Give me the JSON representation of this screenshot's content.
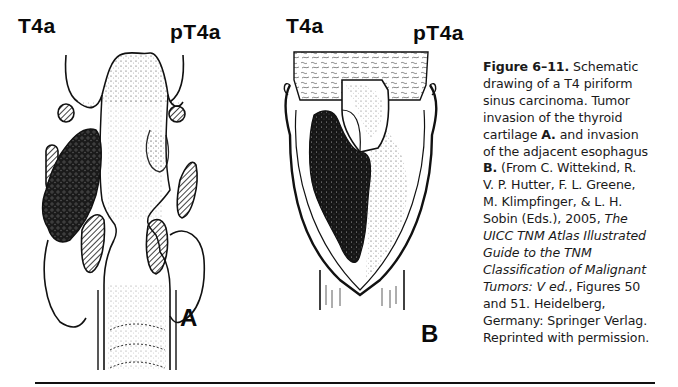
{
  "figure_a": {
    "label_left": "T4a",
    "label_right": "pT4a",
    "panel_letter": "A"
  },
  "figure_b": {
    "label_left": "T4a",
    "label_right": "pT4a",
    "panel_letter": "B"
  },
  "caption": {
    "figure_number": "Figure 6–11.",
    "lines": [
      " Schematic",
      "drawing of a T4 piriform",
      "sinus carcinoma. Tumor",
      "invasion of the thyroid",
      "cartilage ",
      " and invasion",
      "of the adjacent esophagus",
      " (From C. Wittekind, R.",
      "V. P. Hutter, F. L. Greene,",
      "M. Klimpfinger, & L. H.",
      "Sobin (Eds.), 2005, ",
      "UICC TNM Atlas Illustrated",
      "Guide to the TNM",
      "Classification of Malignant",
      "Tumors: V ed.",
      ", Figures 50",
      "and 51. Heidelberg,",
      "Germany: Springer Verlag.",
      "Reprinted with permission."
    ],
    "bold_a": "A.",
    "bold_b": "B.",
    "italic_the": "The"
  }
}
